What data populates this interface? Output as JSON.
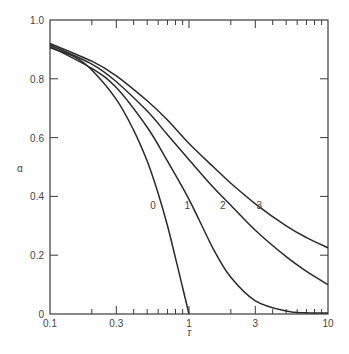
{
  "chart_data": {
    "type": "line",
    "title": "",
    "xlabel": "τ",
    "ylabel": "α",
    "xscale": "log",
    "xlim": [
      0.1,
      10
    ],
    "ylim": [
      0,
      1.0
    ],
    "grid": false,
    "legend": "inline curve labels",
    "x_ticks": [
      {
        "value": 0.1,
        "label": "0.1"
      },
      {
        "value": 0.3,
        "label": "0.3"
      },
      {
        "value": 1,
        "label": "1"
      },
      {
        "value": 3,
        "label": "3"
      },
      {
        "value": 10,
        "label": "10"
      }
    ],
    "y_ticks": [
      {
        "value": 0,
        "label": "0"
      },
      {
        "value": 0.2,
        "label": "0.2"
      },
      {
        "value": 0.4,
        "label": "0.4"
      },
      {
        "value": 0.6,
        "label": "0.6"
      },
      {
        "value": 0.8,
        "label": "0.8"
      },
      {
        "value": 1.0,
        "label": "1.0"
      }
    ],
    "series": [
      {
        "name": "0",
        "label_pos": {
          "x": 0.55,
          "y": 0.37
        },
        "points": [
          [
            0.1,
            0.905
          ],
          [
            0.15,
            0.875
          ],
          [
            0.2,
            0.83
          ],
          [
            0.3,
            0.73
          ],
          [
            0.4,
            0.625
          ],
          [
            0.5,
            0.52
          ],
          [
            0.6,
            0.41
          ],
          [
            0.7,
            0.3
          ],
          [
            0.8,
            0.19
          ],
          [
            0.9,
            0.09
          ],
          [
            1.0,
            0.0
          ]
        ]
      },
      {
        "name": "1",
        "label_pos": {
          "x": 0.97,
          "y": 0.37
        },
        "points": [
          [
            0.1,
            0.91
          ],
          [
            0.2,
            0.835
          ],
          [
            0.3,
            0.77
          ],
          [
            0.5,
            0.635
          ],
          [
            0.7,
            0.52
          ],
          [
            1.0,
            0.39
          ],
          [
            1.5,
            0.22
          ],
          [
            2.0,
            0.125
          ],
          [
            3.0,
            0.045
          ],
          [
            5.0,
            0.01
          ],
          [
            7.0,
            0.004
          ],
          [
            10.0,
            0.003
          ]
        ]
      },
      {
        "name": "2",
        "label_pos": {
          "x": 1.75,
          "y": 0.37
        },
        "points": [
          [
            0.1,
            0.915
          ],
          [
            0.2,
            0.85
          ],
          [
            0.3,
            0.79
          ],
          [
            0.5,
            0.69
          ],
          [
            0.7,
            0.61
          ],
          [
            1.0,
            0.525
          ],
          [
            1.5,
            0.43
          ],
          [
            2.0,
            0.37
          ],
          [
            3.0,
            0.285
          ],
          [
            5.0,
            0.195
          ],
          [
            7.0,
            0.145
          ],
          [
            10.0,
            0.1
          ]
        ]
      },
      {
        "name": "3",
        "label_pos": {
          "x": 3.2,
          "y": 0.37
        },
        "points": [
          [
            0.1,
            0.92
          ],
          [
            0.2,
            0.86
          ],
          [
            0.3,
            0.81
          ],
          [
            0.5,
            0.725
          ],
          [
            0.7,
            0.66
          ],
          [
            1.0,
            0.58
          ],
          [
            1.5,
            0.5
          ],
          [
            2.0,
            0.445
          ],
          [
            3.0,
            0.375
          ],
          [
            5.0,
            0.3
          ],
          [
            7.0,
            0.26
          ],
          [
            10.0,
            0.225
          ]
        ]
      }
    ]
  },
  "colors": {
    "line": "#2a2a2a",
    "axis": "#3a3a3a",
    "text": "#444444",
    "background": "#ffffff"
  }
}
